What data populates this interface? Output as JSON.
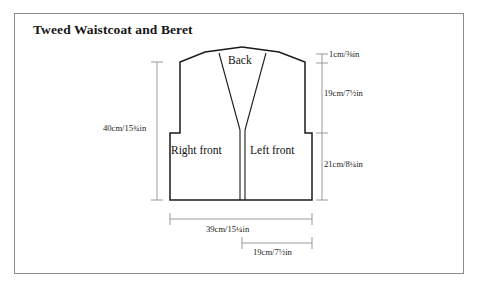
{
  "page": {
    "title": "Tweed Waistcoat and Beret",
    "border_color": "#8a8a8a",
    "background": "#ffffff",
    "line_color": "#1a1a1a",
    "dimension_line_color": "#9a9a9a"
  },
  "diagram": {
    "type": "sewing-pattern-schematic",
    "garment": "waistcoat",
    "panels": [
      {
        "id": "back",
        "label": "Back"
      },
      {
        "id": "right-front",
        "label": "Right front"
      },
      {
        "id": "left-front",
        "label": "Left front"
      }
    ],
    "measurements": [
      {
        "id": "total-length",
        "label": "40cm/15¾in",
        "cm": 40,
        "inches": "15¾",
        "orientation": "vertical",
        "position": "left"
      },
      {
        "id": "shoulder-rise",
        "label": "1cm/⅜in",
        "cm": 1,
        "inches": "⅜",
        "orientation": "vertical",
        "position": "right"
      },
      {
        "id": "armhole-depth",
        "label": "19cm/7½in",
        "cm": 19,
        "inches": "7½",
        "orientation": "vertical",
        "position": "right"
      },
      {
        "id": "underarm-to-hem",
        "label": "21cm/8¼in",
        "cm": 21,
        "inches": "8¼",
        "orientation": "vertical",
        "position": "right"
      },
      {
        "id": "hem-width",
        "label": "39cm/15¼in",
        "cm": 39,
        "inches": "15¼",
        "orientation": "horizontal",
        "position": "bottom"
      },
      {
        "id": "front-half-width",
        "label": "19cm/7½in",
        "cm": 19,
        "inches": "7½",
        "orientation": "horizontal",
        "position": "bottom"
      }
    ]
  }
}
